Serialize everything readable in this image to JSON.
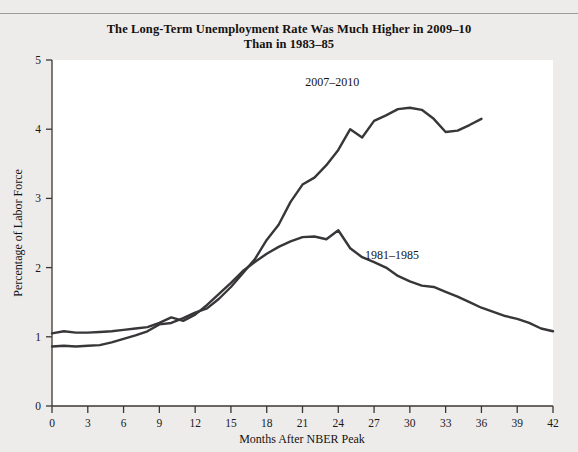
{
  "figure": {
    "title_line1": "The Long-Term Unemployment Rate Was Much Higher in 2009–10",
    "title_line2": "Than in 1983–85"
  },
  "chart_data": {
    "type": "line",
    "title": "The Long-Term Unemployment Rate Was Much Higher in 2009–10 Than in 1983–85",
    "xlabel": "Months After NBER Peak",
    "ylabel": "Percentage of Labor Force",
    "xlim": [
      0,
      42
    ],
    "ylim": [
      0,
      5
    ],
    "xticks": [
      0,
      3,
      6,
      9,
      12,
      15,
      18,
      21,
      24,
      27,
      30,
      33,
      36,
      39,
      42
    ],
    "yticks": [
      0,
      1,
      2,
      3,
      4,
      5
    ],
    "grid": false,
    "legend": "inline-annotations",
    "series": [
      {
        "name": "2007–2010",
        "label_x": 23.5,
        "label_y": 4.62,
        "x": [
          0,
          1,
          2,
          3,
          4,
          5,
          6,
          7,
          8,
          9,
          10,
          11,
          12,
          13,
          14,
          15,
          16,
          17,
          18,
          19,
          20,
          21,
          22,
          23,
          24,
          25,
          26,
          27,
          28,
          29,
          30,
          31,
          32,
          33,
          34,
          35,
          36
        ],
        "values": [
          0.86,
          0.87,
          0.86,
          0.87,
          0.88,
          0.92,
          0.97,
          1.02,
          1.08,
          1.18,
          1.2,
          1.27,
          1.35,
          1.41,
          1.55,
          1.72,
          1.92,
          2.12,
          2.4,
          2.62,
          2.95,
          3.2,
          3.3,
          3.48,
          3.7,
          4.0,
          3.88,
          4.12,
          4.2,
          4.29,
          4.31,
          4.28,
          4.15,
          3.96,
          3.98,
          4.06,
          4.15
        ]
      },
      {
        "name": "1981–1985",
        "label_x": 28.5,
        "label_y": 2.12,
        "x": [
          0,
          1,
          2,
          3,
          4,
          5,
          6,
          7,
          8,
          9,
          10,
          11,
          12,
          13,
          14,
          15,
          16,
          17,
          18,
          19,
          20,
          21,
          22,
          23,
          24,
          25,
          26,
          27,
          28,
          29,
          30,
          31,
          32,
          33,
          34,
          35,
          36,
          37,
          38,
          39,
          40,
          41,
          42
        ],
        "values": [
          1.05,
          1.08,
          1.06,
          1.06,
          1.07,
          1.08,
          1.1,
          1.12,
          1.14,
          1.2,
          1.28,
          1.23,
          1.32,
          1.46,
          1.62,
          1.78,
          1.95,
          2.08,
          2.2,
          2.3,
          2.38,
          2.44,
          2.45,
          2.41,
          2.54,
          2.28,
          2.15,
          2.08,
          2.0,
          1.88,
          1.8,
          1.74,
          1.72,
          1.65,
          1.58,
          1.5,
          1.42,
          1.36,
          1.3,
          1.26,
          1.2,
          1.12,
          1.08
        ]
      }
    ]
  }
}
